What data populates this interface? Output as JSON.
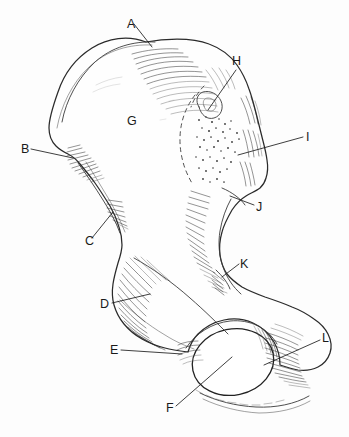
{
  "figure": {
    "background_color": "#fdfdfd",
    "ink_color": "#1c1c1c",
    "width": 349,
    "height": 437
  },
  "labels": [
    {
      "id": "A",
      "text": "A",
      "x": 127,
      "y": 28,
      "leader": [
        [
          134,
          24
        ],
        [
          152,
          47
        ]
      ],
      "has_leader": true
    },
    {
      "id": "B",
      "text": "B",
      "x": 21,
      "y": 153,
      "leader": [
        [
          31,
          149
        ],
        [
          73,
          158
        ]
      ],
      "has_leader": true
    },
    {
      "id": "C",
      "text": "C",
      "x": 85,
      "y": 245,
      "leader": [
        [
          92,
          238
        ],
        [
          113,
          212
        ]
      ],
      "has_leader": true
    },
    {
      "id": "D",
      "text": "D",
      "x": 100,
      "y": 308,
      "leader": [
        [
          112,
          303
        ],
        [
          150,
          294
        ]
      ],
      "has_leader": true
    },
    {
      "id": "E",
      "text": "E",
      "x": 110,
      "y": 354,
      "leader": [
        [
          121,
          350
        ],
        [
          182,
          354
        ]
      ],
      "has_leader": true
    },
    {
      "id": "F",
      "text": "F",
      "x": 166,
      "y": 412,
      "leader": [
        [
          176,
          406
        ],
        [
          232,
          357
        ]
      ],
      "has_leader": true
    },
    {
      "id": "G",
      "text": "G",
      "x": 127,
      "y": 125,
      "leader": null,
      "has_leader": false
    },
    {
      "id": "H",
      "text": "H",
      "x": 232,
      "y": 65,
      "leader": [
        [
          236,
          70
        ],
        [
          208,
          110
        ]
      ],
      "has_leader": true
    },
    {
      "id": "I",
      "text": "I",
      "x": 306,
      "y": 141,
      "leader": [
        [
          303,
          137
        ],
        [
          238,
          155
        ]
      ],
      "has_leader": true
    },
    {
      "id": "J",
      "text": "J",
      "x": 256,
      "y": 211,
      "leader": [
        [
          254,
          205
        ],
        [
          230,
          196
        ]
      ],
      "has_leader": true
    },
    {
      "id": "K",
      "text": "K",
      "x": 240,
      "y": 268,
      "leader": [
        [
          239,
          264
        ],
        [
          222,
          277
        ]
      ],
      "has_leader": true
    },
    {
      "id": "L",
      "text": "L",
      "x": 322,
      "y": 342,
      "leader": [
        [
          320,
          340
        ],
        [
          264,
          365
        ]
      ],
      "has_leader": true
    }
  ]
}
